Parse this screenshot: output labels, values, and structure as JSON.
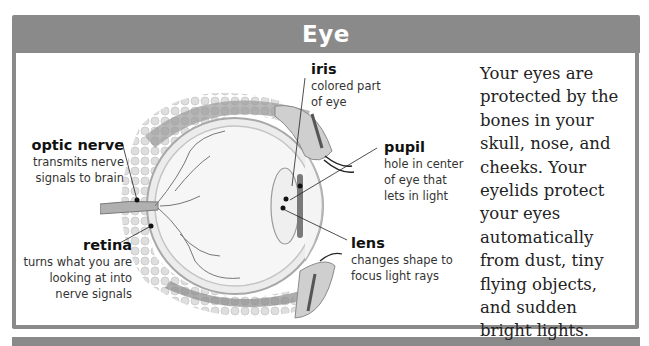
{
  "header": {
    "title": "Eye"
  },
  "labels": {
    "iris": {
      "title": "iris",
      "desc": [
        "colored part",
        "of eye"
      ]
    },
    "optic_nerve": {
      "title": "optic nerve",
      "desc": [
        "transmits nerve",
        "signals to brain"
      ]
    },
    "pupil": {
      "title": "pupil",
      "desc": [
        "hole in center",
        "of eye that",
        "lets in light"
      ]
    },
    "retina": {
      "title": "retina",
      "desc": [
        "turns what you are",
        "looking at into",
        "nerve signals"
      ]
    },
    "lens": {
      "title": "lens",
      "desc": [
        "changes shape to",
        "focus light rays"
      ]
    }
  },
  "body_text": {
    "lines": [
      "Your eyes are",
      "protected by the",
      "bones in your",
      "skull, nose, and",
      "cheeks. Your",
      "eyelids protect",
      "your eyes",
      "automatically",
      "from dust, tiny",
      "flying objects,",
      "and sudden",
      "bright lights."
    ]
  },
  "illustration": {
    "icon": "eye-cross-section-diagram"
  },
  "colors": {
    "frame": "#8a8a8a",
    "header_text": "#ffffff",
    "text": "#222222"
  }
}
